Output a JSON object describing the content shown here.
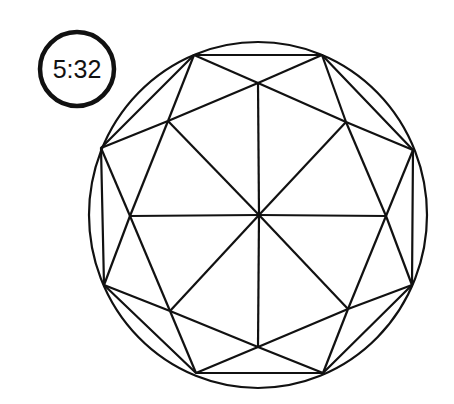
{
  "figure": {
    "label": "5:32",
    "stroke_color": "#111111",
    "background": "#ffffff"
  }
}
